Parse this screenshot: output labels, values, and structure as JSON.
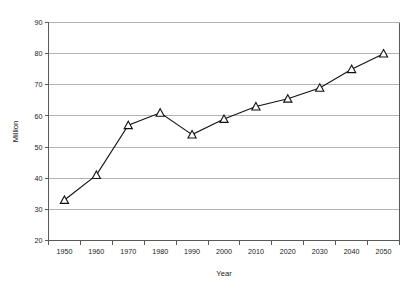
{
  "chart_data": {
    "type": "line",
    "title": "",
    "xlabel": "Year",
    "ylabel": "Million",
    "categories": [
      "1950",
      "1960",
      "1970",
      "1980",
      "1990",
      "2000",
      "2010",
      "2020",
      "2030",
      "2040",
      "2050"
    ],
    "x": [
      1950,
      1960,
      1970,
      1980,
      1990,
      2000,
      2010,
      2020,
      2030,
      2040,
      2050
    ],
    "values": [
      33,
      41,
      57,
      61,
      54,
      59,
      63,
      65.5,
      69,
      75,
      80
    ],
    "series": [
      {
        "name": "Million",
        "values": [
          33,
          41,
          57,
          61,
          54,
          59,
          63,
          65.5,
          69,
          75,
          80
        ]
      }
    ],
    "ylim": [
      20,
      90
    ],
    "yticks": [
      20,
      30,
      40,
      50,
      60,
      70,
      80,
      90
    ],
    "ytick_labels": [
      "20",
      "30",
      "40",
      "50",
      "60",
      "70",
      "80",
      "90"
    ],
    "xtick_labels": [
      "1950",
      "1960",
      "1970",
      "1980",
      "1990",
      "2000",
      "2010",
      "2020",
      "2030",
      "2040",
      "2050"
    ],
    "grid": "horizontal",
    "legend": "none",
    "marker": "open-triangle",
    "line_color": "#111111",
    "marker_fill": "#ffffff",
    "marker_stroke": "#111111",
    "gridline_color": "#b3b3b3",
    "axis_color": "#5a5a5a",
    "background": "#ffffff"
  }
}
